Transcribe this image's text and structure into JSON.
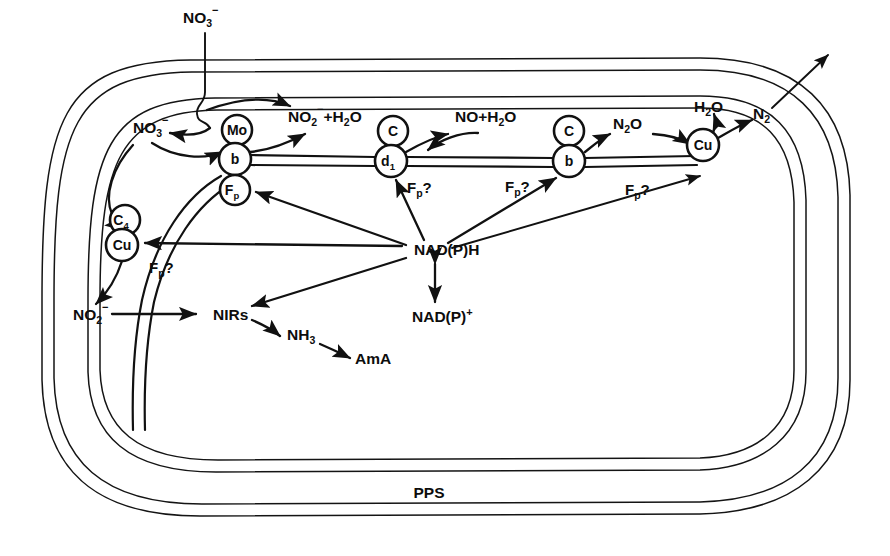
{
  "figure": {
    "background_color": "#ffffff",
    "ink_color": "#111111"
  },
  "compartment": {
    "periplasm_label": "PPS",
    "membrane_line_count": 4
  },
  "metabolites": {
    "nitrate_external": {
      "base": "NO",
      "sub": "3",
      "sup": "−"
    },
    "nitrate_internal": {
      "base": "NO",
      "sub": "3",
      "sup": "−"
    },
    "nitrite_water": {
      "base": "NO",
      "sub": "2",
      "sup": "−",
      "tail": "+H",
      "tail_sub": "2",
      "tail_end": "O"
    },
    "nitric_oxide_water": {
      "base": "NO+H",
      "sub": "2",
      "tail_end": "O"
    },
    "nitrous_oxide": {
      "base": "N",
      "sub": "2",
      "tail_end": "O"
    },
    "water": {
      "base": "H",
      "sub": "2",
      "tail_end": "O"
    },
    "dinitrogen": {
      "base": "N",
      "sub": "2"
    },
    "nitrite_internal": {
      "base": "NO",
      "sub": "2",
      "sup": "−"
    },
    "ammonia": {
      "base": "NH",
      "sub": "3"
    },
    "amino_acid": {
      "base": "AmA"
    },
    "nirs": {
      "base": "NIRs"
    },
    "nadph": {
      "base": "NAD(P)H"
    },
    "nadp_plus": {
      "base": "NAD(P)",
      "sup": "+"
    }
  },
  "carriers": [
    {
      "id": "mo",
      "label": "Mo",
      "sub": "",
      "cx": 237,
      "cy": 130,
      "r": 15
    },
    {
      "id": "b1",
      "label": "b",
      "sub": "",
      "cx": 235,
      "cy": 159,
      "r": 16
    },
    {
      "id": "fp1",
      "label": "F",
      "sub": "p",
      "cx": 235,
      "cy": 190,
      "r": 15
    },
    {
      "id": "c1",
      "label": "C",
      "sub": "",
      "cx": 393,
      "cy": 131,
      "r": 15
    },
    {
      "id": "d1",
      "label": "d",
      "sub": "1",
      "cx": 391,
      "cy": 161,
      "r": 16
    },
    {
      "id": "c2",
      "label": "C",
      "sub": "",
      "cx": 569,
      "cy": 131,
      "r": 15
    },
    {
      "id": "b2",
      "label": "b",
      "sub": "",
      "cx": 569,
      "cy": 161,
      "r": 16
    },
    {
      "id": "cu2",
      "label": "Cu",
      "sub": "",
      "cx": 703,
      "cy": 145,
      "r": 16
    },
    {
      "id": "c4",
      "label": "C",
      "sub": "4",
      "cx": 125,
      "cy": 220,
      "r": 15
    },
    {
      "id": "cu1",
      "label": "Cu",
      "sub": "",
      "cx": 122,
      "cy": 245,
      "r": 16
    }
  ],
  "flavoprotein_queries": [
    {
      "id": "fq1",
      "x": 149,
      "y": 268,
      "base": "F",
      "sub": "p",
      "q": "?"
    },
    {
      "id": "fq2",
      "x": 407,
      "y": 188,
      "base": "F",
      "sub": "p",
      "q": "?"
    },
    {
      "id": "fq3",
      "x": 505,
      "y": 187,
      "base": "F",
      "sub": "p",
      "q": "?"
    },
    {
      "id": "fq4",
      "x": 625,
      "y": 190,
      "base": "F",
      "sub": "p",
      "q": "?"
    }
  ],
  "labels": {
    "nitrate_external_pos": {
      "x": 183,
      "y": 23
    },
    "nitrate_internal_pos": {
      "x": 133,
      "y": 133
    },
    "nitrite_water_pos": {
      "x": 288,
      "y": 122
    },
    "nitric_oxide_water_pos": {
      "x": 455,
      "y": 122
    },
    "nitrous_oxide_pos": {
      "x": 613,
      "y": 129
    },
    "water_pos": {
      "x": 694,
      "y": 112
    },
    "dinitrogen_pos": {
      "x": 753,
      "y": 119
    },
    "nitrite_internal_pos": {
      "x": 73,
      "y": 320
    },
    "nirs_pos": {
      "x": 213,
      "y": 318
    },
    "ammonia_pos": {
      "x": 287,
      "y": 338
    },
    "amino_acid_pos": {
      "x": 355,
      "y": 360
    },
    "nadph_pos": {
      "x": 414,
      "y": 250
    },
    "nadp_plus_pos": {
      "x": 415,
      "y": 318
    },
    "pps_pos": {
      "x": 429,
      "y": 498
    }
  }
}
